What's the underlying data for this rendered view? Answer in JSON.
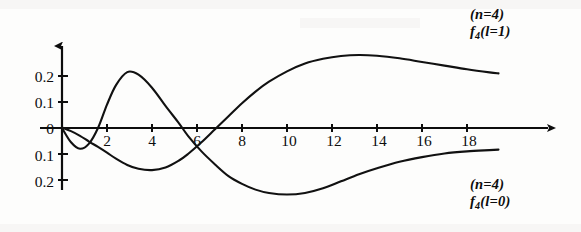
{
  "figure": {
    "title": "",
    "background_color": "#fdfdfc",
    "curve_color": "#111111",
    "axis_color": "#0d0d0d"
  },
  "axes": {
    "x_ticks": [
      "2",
      "4",
      "6",
      "8",
      "10",
      "12",
      "14",
      "16",
      "18"
    ],
    "y_ticks": [
      "0.2",
      "0.1",
      "0",
      "0.1",
      "0.2"
    ],
    "x_arrow": true,
    "y_arrow": true
  },
  "labels": {
    "upper": {
      "line1": "(n=4)",
      "symbol": "f",
      "subscript": "4",
      "rest": "(l=1)"
    },
    "lower": {
      "line1": "(n=4)",
      "symbol": "f",
      "subscript": "4",
      "rest": "(l=0)"
    }
  },
  "chart_data": {
    "type": "line",
    "title": "",
    "xlabel": "",
    "ylabel": "",
    "xlim": [
      0,
      19.5
    ],
    "ylim": [
      -0.28,
      0.3
    ],
    "grid": false,
    "legend_position": "inline-right",
    "x": [
      0,
      0.4,
      0.8,
      1.2,
      1.6,
      2.0,
      2.4,
      2.9,
      3.4,
      4.0,
      4.6,
      5.2,
      5.6,
      6.2,
      6.8,
      7.4,
      8.0,
      8.6,
      9.2,
      10.0,
      10.8,
      11.6,
      12.4,
      13.2,
      14.0,
      15.0,
      16.0,
      17.0,
      18.0,
      19.0,
      19.4
    ],
    "series": [
      {
        "name": "f_4 (l=1)",
        "label_lines": [
          "(n=4)",
          "f4(l=1)"
        ],
        "values": [
          0.0,
          -0.055,
          -0.08,
          -0.06,
          0.0,
          0.09,
          0.165,
          0.215,
          0.205,
          0.155,
          0.085,
          0.018,
          -0.03,
          -0.09,
          -0.14,
          -0.185,
          -0.215,
          -0.237,
          -0.25,
          -0.256,
          -0.25,
          -0.232,
          -0.205,
          -0.178,
          -0.155,
          -0.13,
          -0.112,
          -0.098,
          -0.09,
          -0.085,
          -0.083
        ]
      },
      {
        "name": "f_4 (l=0)",
        "label_lines": [
          "(n=4)",
          "f4(l=0)"
        ],
        "values": [
          0.002,
          -0.012,
          -0.03,
          -0.052,
          -0.073,
          -0.095,
          -0.118,
          -0.142,
          -0.157,
          -0.162,
          -0.152,
          -0.125,
          -0.1,
          -0.055,
          -0.005,
          0.045,
          0.095,
          0.14,
          0.178,
          0.218,
          0.248,
          0.266,
          0.277,
          0.281,
          0.278,
          0.268,
          0.254,
          0.24,
          0.226,
          0.214,
          0.21
        ]
      }
    ]
  }
}
